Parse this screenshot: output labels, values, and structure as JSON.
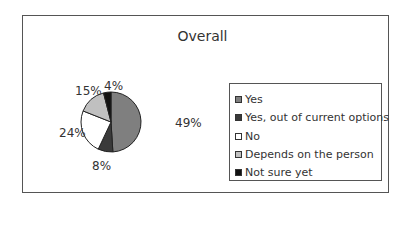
{
  "chart_data": {
    "type": "pie",
    "title": "Overall",
    "categories": [
      "Yes",
      "Yes, out of current options",
      "No",
      "Depends on the person",
      "Not sure yet"
    ],
    "values": [
      49,
      8,
      24,
      15,
      4
    ],
    "labels": [
      "49%",
      "8%",
      "24%",
      "15%",
      "4%"
    ],
    "colors": [
      "#7f7f7f",
      "#3a3a3a",
      "#ffffff",
      "#c0c0c0",
      "#111111"
    ],
    "legend_position": "right"
  }
}
